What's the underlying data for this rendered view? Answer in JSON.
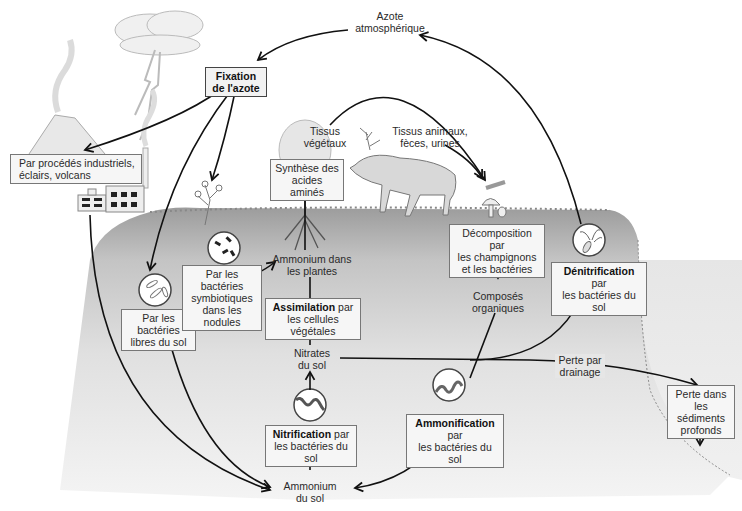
{
  "diagram": {
    "title_nodes": {
      "atmospheric_nitrogen": [
        "Azote",
        "atmosphérique"
      ],
      "fixation": [
        "Fixation",
        "de l'azote"
      ]
    },
    "fixation_sources": {
      "industrial": [
        "Par procédés industriels,",
        "éclairs, volcans"
      ],
      "free_bacteria": [
        "Par les bactéries",
        "libres du sol"
      ],
      "symbiotic_bacteria": [
        "Par les bactéries",
        "symbiotiques",
        "dans les nodules"
      ]
    },
    "plants": {
      "amino_synthesis": [
        "Synthèse des",
        "acides aminés"
      ],
      "ammonium_in_plants": [
        "Ammonium dans",
        "les plantes"
      ],
      "assimilation_bold": "Assimilation",
      "assimilation_rest": " par",
      "assimilation_line2": "les cellules végétales",
      "plant_tissue": [
        "Tissus",
        "végétaux"
      ]
    },
    "animals": {
      "animal_tissue": [
        "Tissus animaux,",
        "fèces, urines"
      ]
    },
    "soil": {
      "nitrates": [
        "Nitrates",
        "du sol"
      ],
      "nitrification_bold": "Nitrification",
      "nitrification_rest": " par",
      "nitrification_line2": "les bactéries du sol",
      "ammonium_soil": [
        "Ammonium",
        "du sol"
      ],
      "ammonification_bold": "Ammonification",
      "ammonification_rest": " par",
      "ammonification_line2": "les bactéries du sol",
      "organic_compounds": [
        "Composés",
        "organiques"
      ],
      "decomposition": [
        "Décomposition par",
        "les champignons",
        "et les bactéries"
      ],
      "denitrification_bold": "Dénitrification",
      "denitrification_rest": " par",
      "denitrification_line2": "les bactéries du sol",
      "drainage_loss": [
        "Perte par",
        "drainage"
      ],
      "sediment_loss": [
        "Perte dans",
        "les sédiments",
        "profonds"
      ]
    },
    "colors": {
      "soil_dark": "#a8a8a8",
      "soil_light": "#e4e4e4",
      "arrow": "#111111",
      "box_border": "#777777"
    }
  }
}
